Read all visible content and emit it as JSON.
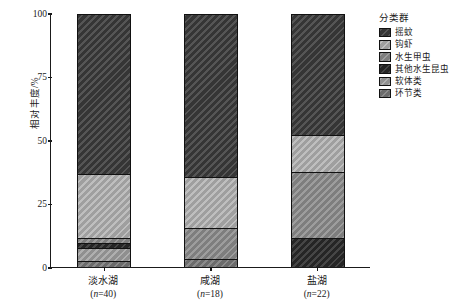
{
  "chart_data": {
    "type": "bar",
    "subtype": "stacked-percentage",
    "title": "",
    "xlabel": "",
    "ylabel": "相对丰度/%",
    "ylim": [
      0,
      100
    ],
    "yticks": [
      0,
      25,
      50,
      75,
      100
    ],
    "grid": false,
    "legend_position": "right",
    "legend_title": "分类群",
    "categories": [
      "淡水湖",
      "咸湖",
      "盐湖"
    ],
    "category_sublabels": [
      "(n=40)",
      "(n=18)",
      "(n=22)"
    ],
    "sample_sizes": [
      40,
      18,
      22
    ],
    "series": [
      {
        "name": "摇蚊",
        "color": "#3c3c3c",
        "pattern": "hatch",
        "values": [
          63.4,
          64.5,
          48.0
        ]
      },
      {
        "name": "钩虾",
        "color": "#b5b5b5",
        "pattern": "hatch",
        "values": [
          25.6,
          20.5,
          14.6
        ]
      },
      {
        "name": "水生甲虫",
        "color": "#8f8f8f",
        "pattern": "hatch",
        "values": [
          2.0,
          12.2,
          26.4
        ]
      },
      {
        "name": "其他水生昆虫",
        "color": "#2a2a2a",
        "pattern": "hatch",
        "values": [
          2.0,
          0.0,
          11.0
        ]
      },
      {
        "name": "软体类",
        "color": "#a3a3a3",
        "pattern": "hatch",
        "values": [
          5.0,
          0.0,
          0.0
        ]
      },
      {
        "name": "环节类",
        "color": "#7a7a7a",
        "pattern": "hatch",
        "values": [
          2.0,
          2.8,
          0.0
        ]
      }
    ]
  },
  "axis": {
    "y_label": "相对丰度/%",
    "y_ticks": [
      "100",
      "75",
      "50",
      "25",
      "0"
    ]
  },
  "legend": {
    "title": "分类群",
    "items": [
      {
        "label": "摇蚊"
      },
      {
        "label": "钩虾"
      },
      {
        "label": "水生甲虫"
      },
      {
        "label": "其他水生昆虫"
      },
      {
        "label": "软体类"
      },
      {
        "label": "环节类"
      }
    ]
  },
  "x_axis": {
    "groups": [
      {
        "name": "淡水湖",
        "n_prefix": "(",
        "n_italic": "n",
        "n_rest": "=40)"
      },
      {
        "name": "咸湖",
        "n_prefix": "(",
        "n_italic": "n",
        "n_rest": "=18)"
      },
      {
        "name": "盐湖",
        "n_prefix": "(",
        "n_italic": "n",
        "n_rest": "=22)"
      }
    ]
  }
}
